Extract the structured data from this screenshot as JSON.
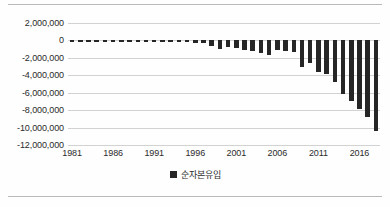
{
  "chart_data": {
    "type": "bar",
    "title": "",
    "xlabel": "",
    "ylabel": "",
    "legend_position": "bottom",
    "grid": true,
    "ylim": [
      -12000000,
      2000000
    ],
    "ytick_values": [
      2000000,
      0,
      -2000000,
      -4000000,
      -6000000,
      -8000000,
      -10000000,
      -12000000
    ],
    "ytick_labels": [
      "2,000,000",
      "0",
      "-2,000,000",
      "-4,000,000",
      "-6,000,000",
      "-8,000,000",
      "-10,000,000",
      "-12,000,000"
    ],
    "xtick_labels": [
      "1981",
      "1986",
      "1991",
      "1996",
      "2001",
      "2006",
      "2011",
      "2016"
    ],
    "xtick_values": [
      1981,
      1986,
      1991,
      1996,
      2001,
      2006,
      2011,
      2016
    ],
    "xlim": [
      1980.5,
      2018.5
    ],
    "series": [
      {
        "name": "순자본유입",
        "color": "#262626",
        "x": [
          1981,
          1982,
          1983,
          1984,
          1985,
          1986,
          1987,
          1988,
          1989,
          1990,
          1991,
          1992,
          1993,
          1994,
          1995,
          1996,
          1997,
          1998,
          1999,
          2000,
          2001,
          2002,
          2003,
          2004,
          2005,
          2006,
          2007,
          2008,
          2009,
          2010,
          2011,
          2012,
          2013,
          2014,
          2015,
          2016,
          2017,
          2018
        ],
        "values": [
          -120000,
          -160000,
          -230000,
          -150000,
          -130000,
          -210000,
          -140000,
          -120000,
          -110000,
          -130000,
          -150000,
          -160000,
          -180000,
          -200000,
          -230000,
          -260000,
          -300000,
          -620000,
          -980000,
          -760000,
          -880000,
          -1050000,
          -1250000,
          -1450000,
          -1700000,
          -1150000,
          -1200000,
          -1380000,
          -3000000,
          -2600000,
          -3600000,
          -3900000,
          -4800000,
          -6200000,
          -6900000,
          -7900000,
          -8800000,
          -10400000
        ]
      }
    ],
    "legend": [
      {
        "label": "순자본유입",
        "color": "#262626",
        "marker": "square"
      }
    ]
  }
}
